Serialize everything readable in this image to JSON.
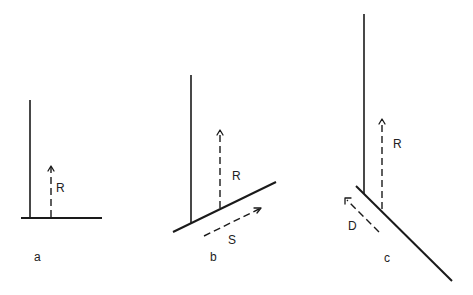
{
  "diagram": {
    "panels": [
      {
        "id": "a",
        "label": "a",
        "vertical_line": {
          "x1": 30,
          "y1": 100,
          "x2": 30,
          "y2": 218
        },
        "base_line": {
          "x1": 21,
          "y1": 218,
          "x2": 102,
          "y2": 218
        },
        "vectors": [
          {
            "name": "R",
            "label": "R",
            "x1": 51,
            "y1": 218,
            "x2": 51,
            "y2": 166,
            "label_x": 56,
            "label_y": 192
          }
        ],
        "label_pos": {
          "x": 34,
          "y": 261
        }
      },
      {
        "id": "b",
        "label": "b",
        "vertical_line": {
          "x1": 191,
          "y1": 75,
          "x2": 191,
          "y2": 224
        },
        "base_line": {
          "x1": 173,
          "y1": 232,
          "x2": 276,
          "y2": 182
        },
        "vectors": [
          {
            "name": "R",
            "label": "R",
            "x1": 220,
            "y1": 208,
            "x2": 220,
            "y2": 130,
            "label_x": 232,
            "label_y": 180
          },
          {
            "name": "S",
            "label": "S",
            "x1": 204,
            "y1": 236,
            "x2": 261,
            "y2": 208,
            "label_x": 228,
            "label_y": 244
          }
        ],
        "label_pos": {
          "x": 210,
          "y": 261
        }
      },
      {
        "id": "c",
        "label": "c",
        "vertical_line": {
          "x1": 364,
          "y1": 14,
          "x2": 364,
          "y2": 194
        },
        "base_line": {
          "x1": 356,
          "y1": 186,
          "x2": 452,
          "y2": 281
        },
        "vectors": [
          {
            "name": "R",
            "label": "R",
            "x1": 382,
            "y1": 209,
            "x2": 382,
            "y2": 119,
            "label_x": 393,
            "label_y": 148
          },
          {
            "name": "D",
            "label": "D",
            "x1": 379,
            "y1": 232,
            "x2": 345,
            "y2": 198,
            "label_x": 348,
            "label_y": 230
          }
        ],
        "label_pos": {
          "x": 384,
          "y": 262
        }
      }
    ],
    "colors": {
      "stroke": "#1a1a1a",
      "background": "#ffffff"
    }
  }
}
